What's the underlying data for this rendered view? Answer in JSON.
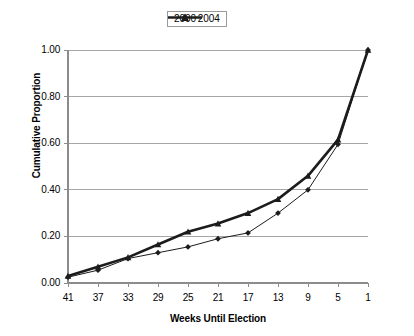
{
  "chart_data": {
    "type": "line",
    "title": "",
    "xlabel": "Weeks Until Election",
    "ylabel": "Cumulative Proportion",
    "x": [
      41,
      37,
      33,
      29,
      25,
      21,
      17,
      13,
      9,
      5,
      1
    ],
    "xtick_labels": [
      "41",
      "37",
      "33",
      "29",
      "25",
      "21",
      "17",
      "13",
      "9",
      "5",
      "1"
    ],
    "ytick_labels": [
      "0.00",
      "0.20",
      "0.40",
      "0.60",
      "0.80",
      "1.00"
    ],
    "ytick_values": [
      0.0,
      0.2,
      0.4,
      0.6,
      0.8,
      1.0
    ],
    "ylim": [
      0.0,
      1.0
    ],
    "xlim": [
      41,
      1
    ],
    "grid": "horizontal",
    "legend_position": "top-center",
    "series": [
      {
        "name": "2000",
        "marker": "diamond",
        "color": "#1c1c1c",
        "line_width": 1,
        "values": [
          0.025,
          0.055,
          0.105,
          0.13,
          0.155,
          0.19,
          0.215,
          0.3,
          0.4,
          0.595,
          1.0
        ]
      },
      {
        "name": "2004",
        "marker": "triangle",
        "color": "#1c1c1c",
        "line_width": 2.6,
        "values": [
          0.03,
          0.07,
          0.11,
          0.165,
          0.22,
          0.255,
          0.3,
          0.36,
          0.46,
          0.615,
          1.0
        ]
      }
    ]
  },
  "legend": {
    "items": [
      {
        "label": "2000",
        "marker": "diamond"
      },
      {
        "label": "2004",
        "marker": "triangle"
      }
    ]
  }
}
